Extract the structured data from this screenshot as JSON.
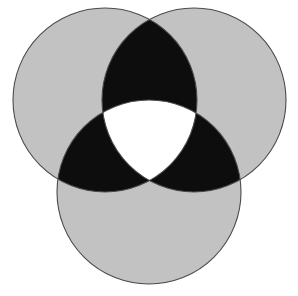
{
  "figure": {
    "width": 298,
    "height": 296,
    "background_color": "#ffffff"
  },
  "chart_data": {
    "type": "venn",
    "title": "",
    "subtitle": "",
    "xlabel": "",
    "ylabel": "",
    "grid": false,
    "legend_position": "none",
    "set_count": 3,
    "canvas": {
      "width": 298,
      "height": 296
    },
    "circle_radius": 92,
    "circles": [
      {
        "id": "A",
        "label": "",
        "cx": 105,
        "cy": 100,
        "r": 92,
        "position": "top-left"
      },
      {
        "id": "B",
        "label": "",
        "cx": 194,
        "cy": 100,
        "r": 92,
        "position": "top-right"
      },
      {
        "id": "C",
        "label": "",
        "cx": 149,
        "cy": 192,
        "r": 92,
        "position": "bottom"
      }
    ],
    "regions": [
      {
        "id": "only-A",
        "sets": [
          "A"
        ],
        "coverage": 1,
        "fill": "#c2c2c2",
        "label": ""
      },
      {
        "id": "only-B",
        "sets": [
          "B"
        ],
        "coverage": 1,
        "fill": "#c2c2c2",
        "label": ""
      },
      {
        "id": "only-C",
        "sets": [
          "C"
        ],
        "coverage": 1,
        "fill": "#c2c2c2",
        "label": ""
      },
      {
        "id": "A-and-B",
        "sets": [
          "A",
          "B"
        ],
        "coverage": 2,
        "fill": "#0d0d0d",
        "label": ""
      },
      {
        "id": "A-and-C",
        "sets": [
          "A",
          "C"
        ],
        "coverage": 2,
        "fill": "#0d0d0d",
        "label": ""
      },
      {
        "id": "B-and-C",
        "sets": [
          "B",
          "C"
        ],
        "coverage": 2,
        "fill": "#0d0d0d",
        "label": ""
      },
      {
        "id": "A-B-C",
        "sets": [
          "A",
          "B",
          "C"
        ],
        "coverage": 3,
        "fill": "#ffffff",
        "label": ""
      }
    ],
    "colors": {
      "single_overlap": "#c2c2c2",
      "double_overlap": "#0d0d0d",
      "triple_overlap": "#ffffff",
      "outline": "#4a4a4a",
      "background": "#ffffff"
    },
    "outline": {
      "stroke": "#4a4a4a",
      "stroke_width": 1.1
    },
    "key_points": {
      "top_vertex": [
        149,
        18
      ],
      "bottom_vertex": [
        149,
        190
      ],
      "left_lens_tip": [
        62,
        140
      ],
      "right_lens_tip": [
        237,
        140
      ],
      "leftmost_edge_x": 13,
      "rightmost_edge_x": 286,
      "topmost_edge_y": 11,
      "bottommost_edge_y": 284
    }
  }
}
